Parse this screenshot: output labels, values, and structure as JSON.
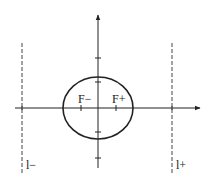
{
  "diagram": {
    "type": "ellipse-with-foci-and-directrices",
    "colors": {
      "stroke": "#222222",
      "dashed": "#444444",
      "background": "#ffffff"
    },
    "labels": {
      "focus_minus": "F−",
      "focus_plus": "F+",
      "directrix_minus": "l−",
      "directrix_plus": "l+"
    }
  }
}
